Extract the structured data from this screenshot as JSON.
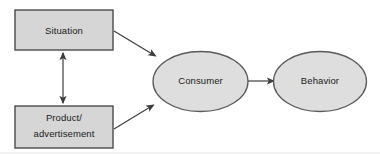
{
  "diagram": {
    "background_color": "#ffffff",
    "box_fill_color": "#d6d6d6",
    "box_stroke_color": "#4a4a4a",
    "ellipse_fill_color": "#dedede",
    "ellipse_stroke_color": "#5a5a5a",
    "arrow_color": "#3d3d3d",
    "text_color": "#1a1a1a",
    "nodes": [
      {
        "id": "situation",
        "shape": "rectangle",
        "label": "Situation",
        "lines": [
          "Situation"
        ]
      },
      {
        "id": "product-advertisement",
        "shape": "rectangle",
        "label": "Product/ advertisement",
        "lines": [
          "Product/",
          "advertisement"
        ]
      },
      {
        "id": "consumer",
        "shape": "ellipse",
        "label": "Consumer",
        "lines": [
          "Consumer"
        ]
      },
      {
        "id": "behavior",
        "shape": "ellipse",
        "label": "Behavior",
        "lines": [
          "Behavior"
        ]
      }
    ],
    "edges": [
      {
        "id": "situation-to-consumer",
        "from": "situation",
        "to": "consumer",
        "style": "single-arrow"
      },
      {
        "id": "product-to-consumer",
        "from": "product-advertisement",
        "to": "consumer",
        "style": "single-arrow"
      },
      {
        "id": "situation-product-link",
        "from": "situation",
        "to": "product-advertisement",
        "style": "double-arrow"
      },
      {
        "id": "consumer-to-behavior",
        "from": "consumer",
        "to": "behavior",
        "style": "single-arrow"
      }
    ]
  }
}
